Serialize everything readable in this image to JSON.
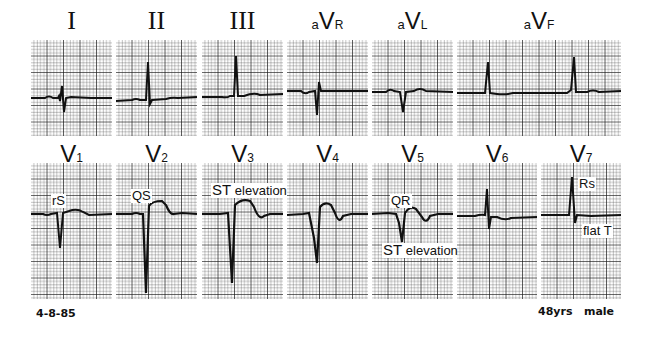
{
  "figure": {
    "type": "12-lead ECG with V7",
    "grid_color": "#1a1a1a",
    "trace_color": "#111111",
    "background": "#ffffff"
  },
  "top_row": [
    {
      "id": "I",
      "label": "I",
      "style": "roman"
    },
    {
      "id": "II",
      "label": "II",
      "style": "roman"
    },
    {
      "id": "III",
      "label": "III",
      "style": "roman"
    },
    {
      "id": "aVR",
      "prefix": "a",
      "main": "V",
      "sub": "R"
    },
    {
      "id": "aVL",
      "prefix": "a",
      "main": "V",
      "sub": "L"
    },
    {
      "id": "aVF",
      "prefix": "a",
      "main": "V",
      "sub": "F"
    }
  ],
  "bottom_row": [
    {
      "id": "V1",
      "main": "V",
      "sub": "1"
    },
    {
      "id": "V2",
      "main": "V",
      "sub": "2"
    },
    {
      "id": "V3",
      "main": "V",
      "sub": "3"
    },
    {
      "id": "V4",
      "main": "V",
      "sub": "4"
    },
    {
      "id": "V5",
      "main": "V",
      "sub": "5"
    },
    {
      "id": "V6",
      "main": "V",
      "sub": "6"
    },
    {
      "id": "V7",
      "main": "V",
      "sub": "7"
    }
  ],
  "annotations": {
    "V1": "rS",
    "V2": "QS",
    "V3_st": "ST",
    "V3_elev": "elevation",
    "V5_qr": "QR",
    "V5_st": "ST",
    "V5_elev": "elevation",
    "V7_rs": "Rs",
    "V7_flat": "flat T"
  },
  "footer": {
    "date": "4-8-85",
    "patient": "48yrs   male"
  }
}
